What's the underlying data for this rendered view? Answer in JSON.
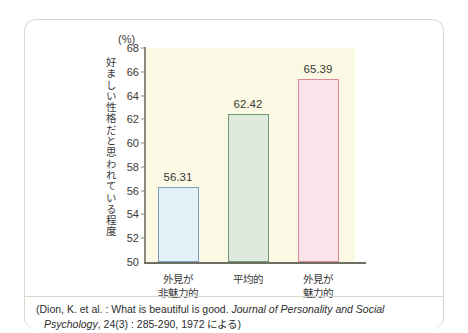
{
  "chart_data": {
    "type": "bar",
    "title": "",
    "subtitle": "",
    "unit_label": "(%)",
    "ylabel": "好ましい性格だと思われている程度",
    "xlabel": "",
    "categories": [
      "外見が非魅力的",
      "平均的",
      "外見が魅力的"
    ],
    "category_lines": [
      [
        "外見が",
        "非魅力的"
      ],
      [
        "平均的",
        ""
      ],
      [
        "外見が",
        "魅力的"
      ]
    ],
    "values": [
      56.31,
      62.42,
      65.39
    ],
    "value_labels": [
      "56.31",
      "62.42",
      "65.39"
    ],
    "ylim": [
      50,
      68
    ],
    "ytick_labels": [
      "68",
      "66",
      "64",
      "62",
      "60",
      "58",
      "56",
      "54",
      "52",
      "50"
    ],
    "yticks": [
      68,
      66,
      64,
      62,
      60,
      58,
      56,
      54,
      52,
      50
    ],
    "grid": false,
    "legend": null,
    "bar_colors": [
      "#e3f0f8",
      "#dfeade",
      "#fbe4e9"
    ],
    "bar_border_colors": [
      "#7a9dc0",
      "#6f9a72",
      "#d98a9d"
    ],
    "plot_background": "#fbf9e3",
    "axis_color": "#6e6e63"
  },
  "caption": {
    "line1_pre": "(Dion, K. et al. : What is beautiful is good. ",
    "line1_italic": "Journal of Personality and Social",
    "line2_italic": "Psychology",
    "line2_post": ", 24(3) : 285-290, 1972 による)"
  }
}
